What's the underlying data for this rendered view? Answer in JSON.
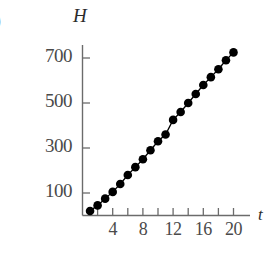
{
  "figure": {
    "edge_glyph": ")",
    "y_axis_label": "H",
    "x_axis_label": "t"
  },
  "chart_data": {
    "type": "scatter",
    "title": "",
    "subtitle": "",
    "xlabel": "t",
    "ylabel": "H",
    "grid": false,
    "legend": false,
    "marker": "filled-circle",
    "line_connecting_points": true,
    "xlim": [
      0,
      21
    ],
    "ylim": [
      0,
      760
    ],
    "x_ticks_major": [
      4,
      8,
      12,
      16,
      20
    ],
    "x_ticks_minor": [
      2,
      6,
      10,
      14,
      18
    ],
    "x_tick_labels": [
      "4",
      "8",
      "12",
      "16",
      "20"
    ],
    "y_ticks": [
      100,
      300,
      500,
      700
    ],
    "y_tick_labels": [
      "100",
      "300",
      "500",
      "700"
    ],
    "x": [
      1,
      2,
      3,
      4,
      5,
      6,
      7,
      8,
      9,
      10,
      11,
      12,
      13,
      14,
      15,
      16,
      17,
      18,
      19,
      20
    ],
    "values": [
      20,
      45,
      75,
      105,
      140,
      180,
      215,
      250,
      290,
      330,
      360,
      425,
      460,
      500,
      540,
      580,
      615,
      650,
      690,
      725
    ],
    "series": [
      {
        "name": "H(t)",
        "color": "#000000",
        "values": [
          20,
          45,
          75,
          105,
          140,
          180,
          215,
          250,
          290,
          330,
          360,
          425,
          460,
          500,
          540,
          580,
          615,
          650,
          690,
          725
        ]
      }
    ]
  }
}
